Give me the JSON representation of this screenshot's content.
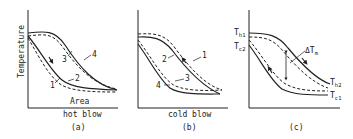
{
  "figure": {
    "panels": [
      {
        "id": "a",
        "caption": "(a)",
        "subtitle": "hot blow",
        "xlabel": "Area",
        "ylabel": "Temperature",
        "curve_labels": [
          "1",
          "2",
          "3",
          "4"
        ]
      },
      {
        "id": "b",
        "caption": "(b)",
        "subtitle": "cold blow",
        "curve_labels": [
          "1",
          "2",
          "3",
          "4"
        ]
      },
      {
        "id": "c",
        "caption": "(c)",
        "labels": {
          "th1": "T",
          "th1_sub": "h1",
          "tc2": "T",
          "tc2_sub": "c2",
          "th2": "T",
          "th2_sub": "h2",
          "tc1": "T",
          "tc1_sub": "c1",
          "dtm": "ΔT",
          "dtm_sub": "m"
        }
      }
    ],
    "colors": {
      "ink": "#222222",
      "background": "#ffffff"
    }
  }
}
